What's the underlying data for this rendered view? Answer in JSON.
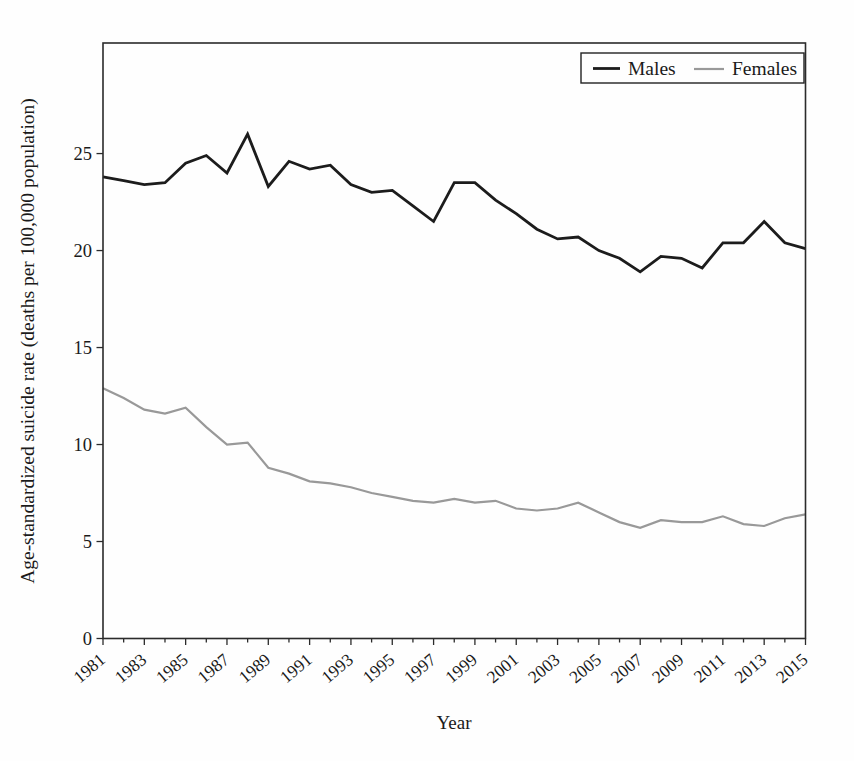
{
  "figure": {
    "background": "#fefefe",
    "text_color": "#1a1a1a",
    "spine_color": "#2b2b2b"
  },
  "chart_data": {
    "type": "line",
    "title": "",
    "xlabel": "Year",
    "ylabel": "Age-standardized suicide rate (deaths per 100,000 population)",
    "x": [
      1981,
      1982,
      1983,
      1984,
      1985,
      1986,
      1987,
      1988,
      1989,
      1990,
      1991,
      1992,
      1993,
      1994,
      1995,
      1996,
      1997,
      1998,
      1999,
      2000,
      2001,
      2002,
      2003,
      2004,
      2005,
      2006,
      2007,
      2008,
      2009,
      2010,
      2011,
      2012,
      2013,
      2014,
      2015
    ],
    "series": [
      {
        "name": "Males",
        "color": "#1c1c1c",
        "stroke_width": 2.8,
        "values": [
          23.8,
          23.6,
          23.4,
          23.5,
          24.5,
          24.9,
          24.0,
          26.0,
          23.3,
          24.6,
          24.2,
          24.4,
          23.4,
          23.0,
          23.1,
          22.3,
          21.5,
          23.5,
          23.5,
          22.6,
          21.9,
          21.1,
          20.6,
          20.7,
          20.0,
          19.6,
          18.9,
          19.7,
          19.6,
          19.1,
          20.4,
          20.4,
          21.5,
          20.4,
          20.1
        ]
      },
      {
        "name": "Females",
        "color": "#999999",
        "stroke_width": 2.2,
        "values": [
          12.9,
          12.4,
          11.8,
          11.6,
          11.9,
          10.9,
          10.0,
          10.1,
          8.8,
          8.5,
          8.1,
          8.0,
          7.8,
          7.5,
          7.3,
          7.1,
          7.0,
          7.2,
          7.0,
          7.1,
          6.7,
          6.6,
          6.7,
          7.0,
          6.5,
          6.0,
          5.7,
          6.1,
          6.0,
          6.0,
          6.3,
          5.9,
          5.8,
          6.2,
          6.4
        ]
      }
    ],
    "ylim": [
      0,
      30.7
    ],
    "yticks": [
      0,
      5,
      10,
      15,
      20,
      25
    ],
    "xtick_label_step": 2,
    "x_tick_label_rotation_deg": 40,
    "grid": false,
    "legend_position": "top-right"
  }
}
